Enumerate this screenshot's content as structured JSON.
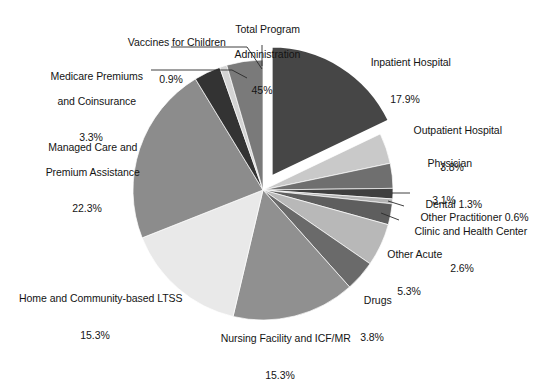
{
  "chart_data": {
    "type": "pie",
    "title": "",
    "subtitle": "",
    "xlabel": "",
    "ylabel": "",
    "legend_position": "callout-labels",
    "grid": false,
    "exploded_slice": "Inpatient Hospital",
    "start_angle_deg": -90,
    "direction": "clockwise",
    "categories": [
      "Inpatient Hospital",
      "Outpatient Hospital",
      "Physician",
      "Dental",
      "Other Practitioner",
      "Clinic and Health Center",
      "Other Acute",
      "Drugs",
      "Nursing Facility and ICF/MR",
      "Home and Community-based LTSS",
      "Managed Care and Premium Assistance",
      "Medicare Premiums and Coinsurance",
      "Vaccines for Children",
      "Total Program Administration"
    ],
    "values": [
      17.9,
      3.8,
      3.1,
      1.3,
      0.6,
      2.6,
      5.3,
      3.8,
      15.3,
      15.3,
      22.3,
      3.3,
      0.9,
      4.5
    ],
    "value_suffix": "%",
    "colors": [
      "#464646",
      "#c9c9c9",
      "#6f6f6f",
      "#3f3f3f",
      "#b4b4b4",
      "#5e5e5e",
      "#b8b8b8",
      "#6a6a6a",
      "#909090",
      "#e9e9e9",
      "#8c8c8c",
      "#333333",
      "#d4d4d4",
      "#7a7a7a"
    ]
  },
  "labels": {
    "vaccines_for_children": {
      "name": "Vaccines for Children",
      "pct": "0.9%"
    },
    "total_program_administration": {
      "line1": "Total Program",
      "line2": "Administration",
      "pct": "45%"
    },
    "medicare_premiums": {
      "line1": "Medicare Premiums",
      "line2": "and Coinsurance",
      "pct": "3.3%"
    },
    "managed_care": {
      "line1": "Managed Care and",
      "line2": "Premium Assistance",
      "pct": "22.3%"
    },
    "home_community_ltss": {
      "name": "Home and Community-based LTSS",
      "pct": "15.3%"
    },
    "nursing_facility": {
      "name": "Nursing Facility and ICF/MR",
      "pct": "15.3%"
    },
    "drugs": {
      "name": "Drugs",
      "pct": "3.8%"
    },
    "other_acute": {
      "name": "Other Acute",
      "pct": "5.3%"
    },
    "clinic_health_center": {
      "line1": "Clinic and Health Center",
      "pct": "2.6%"
    },
    "other_practitioner": {
      "name": "Other Practitioner 0.6%"
    },
    "dental": {
      "name": "Dental 1.3%"
    },
    "physician": {
      "name": "Physician",
      "pct": "3.1%"
    },
    "outpatient_hospital": {
      "name": "Outpatient Hospital",
      "pct": "3.8%"
    },
    "inpatient_hospital": {
      "name": "Inpatient Hospital",
      "pct": "17.9%"
    }
  }
}
